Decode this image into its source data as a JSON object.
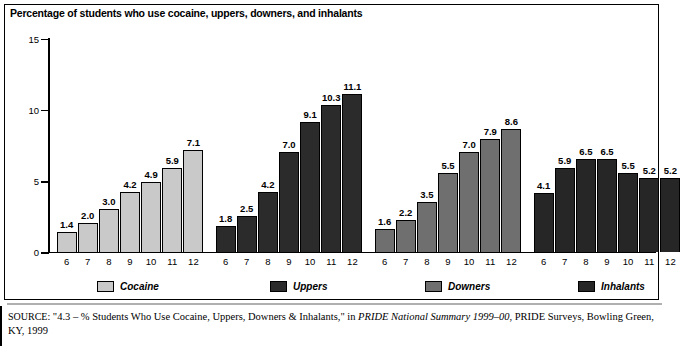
{
  "chart": {
    "title": "Percentage of students who use cocaine, uppers, downers, and inhalants"
  },
  "source_note": {
    "keyword": "SOURCE:",
    "part1": " \"4.3 – % Students Who Use Cocaine, Uppers, Downers & Inhalants,\" in ",
    "italic": "PRIDE National Summary 1999–00",
    "part2": ", PRIDE Surveys, Bowling Green, KY, 1999"
  },
  "legend": [
    {
      "label": "Cocaine",
      "color": "#c9c9c9"
    },
    {
      "label": "Uppers",
      "color": "#2b2b2b"
    },
    {
      "label": "Downers",
      "color": "#6f6f6f"
    },
    {
      "label": "Inhalants",
      "color": "#262626"
    }
  ],
  "chart_data": {
    "type": "bar",
    "title": "Percentage of students who use cocaine, uppers, downers, and inhalants",
    "xlabel": "",
    "ylabel": "",
    "ylim": [
      0,
      15
    ],
    "yticks": [
      0,
      5,
      10,
      15
    ],
    "ytick_labels": [
      "0",
      "5",
      "10",
      "15"
    ],
    "grid": false,
    "legend_position": "bottom",
    "categories": [
      "6",
      "7",
      "8",
      "9",
      "10",
      "11",
      "12"
    ],
    "group_axis_label": "grade",
    "series": [
      {
        "name": "Cocaine",
        "color": "#c9c9c9",
        "values": [
          1.4,
          2.0,
          3.0,
          4.2,
          4.9,
          5.9,
          7.1
        ],
        "value_labels": [
          "1.4",
          "2.0",
          "3.0",
          "4.2",
          "4.9",
          "5.9",
          "7.1"
        ]
      },
      {
        "name": "Uppers",
        "color": "#2b2b2b",
        "values": [
          1.8,
          2.5,
          4.2,
          7.0,
          9.1,
          10.3,
          11.1
        ],
        "value_labels": [
          "1.8",
          "2.5",
          "4.2",
          "7.0",
          "9.1",
          "10.3",
          "11.1"
        ]
      },
      {
        "name": "Downers",
        "color": "#6f6f6f",
        "values": [
          1.6,
          2.2,
          3.5,
          5.5,
          7.0,
          7.9,
          8.6
        ],
        "value_labels": [
          "1.6",
          "2.2",
          "3.5",
          "5.5",
          "7.0",
          "7.9",
          "8.6"
        ]
      },
      {
        "name": "Inhalants",
        "color": "#262626",
        "values": [
          4.1,
          5.9,
          6.5,
          6.5,
          5.5,
          5.2,
          5.2
        ],
        "value_labels": [
          "4.1",
          "5.9",
          "6.5",
          "6.5",
          "5.5",
          "5.2",
          "5.2"
        ]
      }
    ]
  }
}
